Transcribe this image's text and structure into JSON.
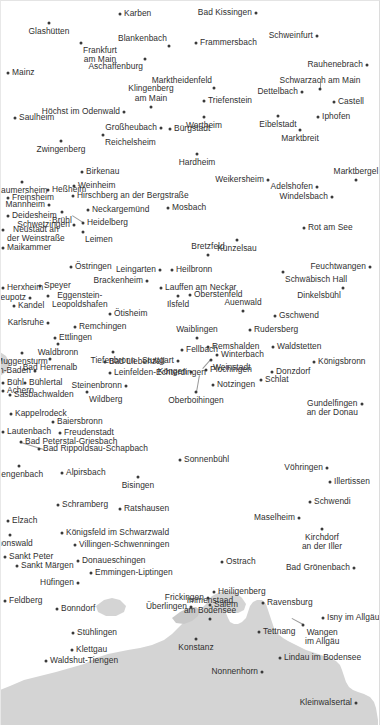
{
  "map": {
    "title": "Germany south-west place-name map",
    "background_color": "#ffffff",
    "dot_color": "#3a3a3a",
    "label_color": "#2f2f2f",
    "shaded_region_color": "#d3d3d3",
    "shaded_region_name": "neighbouring-country-shading",
    "cities": [
      {
        "name": "Karben",
        "x": 120,
        "y": 14,
        "pos": "pos-r"
      },
      {
        "name": "Bad Kissingen",
        "x": 256,
        "y": 13,
        "pos": "pos-l"
      },
      {
        "name": "Glashütten",
        "x": 49,
        "y": 23,
        "pos": "pos-b"
      },
      {
        "name": "Schweinfurt",
        "x": 317,
        "y": 36,
        "pos": "pos-l"
      },
      {
        "name": "Blankenbach",
        "x": 169,
        "y": 46,
        "pos": "pos-tl"
      },
      {
        "name": "Frammersbach",
        "x": 196,
        "y": 43,
        "pos": "pos-r"
      },
      {
        "name": "Frankfurt\nam Main",
        "x": 81,
        "y": 43,
        "pos": "pos-br",
        "lines": 2
      },
      {
        "name": "Rauhenebrach",
        "x": 367,
        "y": 65,
        "pos": "pos-l"
      },
      {
        "name": "Aschaffenburg",
        "x": 145,
        "y": 59,
        "pos": "pos-bl"
      },
      {
        "name": "Schwarzach am Main",
        "x": 320,
        "y": 89,
        "pos": "pos-t"
      },
      {
        "name": "Mainz",
        "x": 8,
        "y": 73,
        "pos": "pos-r"
      },
      {
        "name": "Marktheidenfeld",
        "x": 214,
        "y": 88,
        "pos": "pos-tl"
      },
      {
        "name": "Dettelbach",
        "x": 302,
        "y": 92,
        "pos": "pos-l"
      },
      {
        "name": "Castell",
        "x": 334,
        "y": 102,
        "pos": "pos-r"
      },
      {
        "name": "Klingenberg\nam Main",
        "x": 151,
        "y": 107,
        "pos": "pos-t",
        "lines": 2
      },
      {
        "name": "Triefenstein",
        "x": 204,
        "y": 101,
        "pos": "pos-r"
      },
      {
        "name": "Höchst im Odenwald",
        "x": 124,
        "y": 112,
        "pos": "pos-l"
      },
      {
        "name": "Wertheim",
        "x": 204,
        "y": 117,
        "pos": "pos-b"
      },
      {
        "name": "Eibelstadt",
        "x": 278,
        "y": 116,
        "pos": "pos-b"
      },
      {
        "name": "Iphofen",
        "x": 318,
        "y": 117,
        "pos": "pos-r"
      },
      {
        "name": "Saulheim",
        "x": 15,
        "y": 118,
        "pos": "pos-r"
      },
      {
        "name": "Großheubach",
        "x": 161,
        "y": 128,
        "pos": "pos-l"
      },
      {
        "name": "Bürgstadt",
        "x": 170,
        "y": 129,
        "pos": "pos-r"
      },
      {
        "name": "Marktbreit",
        "x": 300,
        "y": 130,
        "pos": "pos-b"
      },
      {
        "name": "Reichelsheim",
        "x": 103,
        "y": 135,
        "pos": "pos-br"
      },
      {
        "name": "Zwingenberg",
        "x": 61,
        "y": 141,
        "pos": "pos-b"
      },
      {
        "name": "Hardheim",
        "x": 197,
        "y": 154,
        "pos": "pos-b"
      },
      {
        "name": "Weikersheim",
        "x": 268,
        "y": 180,
        "pos": "pos-l"
      },
      {
        "name": "Marktbergel",
        "x": 356,
        "y": 180,
        "pos": "pos-t"
      },
      {
        "name": "Laumersheim",
        "x": 22,
        "y": 182,
        "pos": "pos-b"
      },
      {
        "name": "Birkenau",
        "x": 82,
        "y": 172,
        "pos": "pos-r"
      },
      {
        "name": "Adelshofen",
        "x": 317,
        "y": 187,
        "pos": "pos-l"
      },
      {
        "name": "Heßheim",
        "x": 48,
        "y": 190,
        "pos": "pos-r"
      },
      {
        "name": "Weinheim",
        "x": 74,
        "y": 186,
        "pos": "pos-r"
      },
      {
        "name": "Windelsbach",
        "x": 332,
        "y": 197,
        "pos": "pos-l"
      },
      {
        "name": "Freinsheim",
        "x": 8,
        "y": 198,
        "pos": "pos-r"
      },
      {
        "name": "Hirschberg an der Bergstraße",
        "x": 73,
        "y": 196,
        "pos": "pos-r"
      },
      {
        "name": "Mosbach",
        "x": 168,
        "y": 208,
        "pos": "pos-r"
      },
      {
        "name": "Mannheim",
        "x": 49,
        "y": 205,
        "pos": "pos-l"
      },
      {
        "name": "Neckargemünd",
        "x": 88,
        "y": 210,
        "pos": "pos-r"
      },
      {
        "name": "Deidesheim",
        "x": 8,
        "y": 216,
        "pos": "pos-r"
      },
      {
        "name": "Brühl",
        "x": 62,
        "y": 212,
        "pos": "pos-b"
      },
      {
        "name": "Heidelberg",
        "x": 83,
        "y": 223,
        "pos": "pos-r"
      },
      {
        "name": "Schwetzingen",
        "x": 74,
        "y": 225,
        "pos": "pos-l"
      },
      {
        "name": "Rot am See",
        "x": 304,
        "y": 228,
        "pos": "pos-r"
      },
      {
        "name": "Künzelsau",
        "x": 237,
        "y": 240,
        "pos": "pos-b"
      },
      {
        "name": "Leimen",
        "x": 83,
        "y": 232,
        "pos": "pos-br"
      },
      {
        "name": "Neustadt an\nder Weinstraße",
        "x": 3,
        "y": 230,
        "pos": "pos-r",
        "lines": 2
      },
      {
        "name": "Feuchtwangen",
        "x": 370,
        "y": 267,
        "pos": "pos-l"
      },
      {
        "name": "Maikammer",
        "x": 3,
        "y": 248,
        "pos": "pos-r"
      },
      {
        "name": "Bretzfeld",
        "x": 208,
        "y": 255,
        "pos": "pos-t"
      },
      {
        "name": "Östringen",
        "x": 71,
        "y": 267,
        "pos": "pos-r"
      },
      {
        "name": "Leingarten",
        "x": 160,
        "y": 270,
        "pos": "pos-l"
      },
      {
        "name": "Heilbronn",
        "x": 172,
        "y": 270,
        "pos": "pos-r"
      },
      {
        "name": "Schwäbisch Hall",
        "x": 283,
        "y": 272,
        "pos": "pos-br"
      },
      {
        "name": "Brackenheim",
        "x": 147,
        "y": 281,
        "pos": "pos-l"
      },
      {
        "name": "Lauffen am Neckar",
        "x": 161,
        "y": 288,
        "pos": "pos-r"
      },
      {
        "name": "Dinkelsbühl",
        "x": 343,
        "y": 288,
        "pos": "pos-bl"
      },
      {
        "name": "Herxheim",
        "x": 3,
        "y": 288,
        "pos": "pos-r"
      },
      {
        "name": "Speyer",
        "x": 40,
        "y": 286,
        "pos": "pos-r"
      },
      {
        "name": "Eggenstein-\nLeopoldshafen",
        "x": 48,
        "y": 296,
        "pos": "pos-r",
        "lines": 2
      },
      {
        "name": "Ilsfeld",
        "x": 178,
        "y": 296,
        "pos": "pos-b"
      },
      {
        "name": "Oberstenfeld",
        "x": 190,
        "y": 295,
        "pos": "pos-r"
      },
      {
        "name": "Neupotz",
        "x": 30,
        "y": 298,
        "pos": "pos-l"
      },
      {
        "name": "Auenwald",
        "x": 243,
        "y": 311,
        "pos": "pos-t"
      },
      {
        "name": "Kandel",
        "x": 14,
        "y": 306,
        "pos": "pos-r"
      },
      {
        "name": "Ötisheim",
        "x": 110,
        "y": 314,
        "pos": "pos-r"
      },
      {
        "name": "Gschwend",
        "x": 275,
        "y": 316,
        "pos": "pos-r"
      },
      {
        "name": "Karlsruhe",
        "x": 48,
        "y": 323,
        "pos": "pos-l"
      },
      {
        "name": "Remchingen",
        "x": 75,
        "y": 327,
        "pos": "pos-r"
      },
      {
        "name": "Rudersberg",
        "x": 250,
        "y": 330,
        "pos": "pos-r"
      },
      {
        "name": "Waiblingen",
        "x": 197,
        "y": 338,
        "pos": "pos-t"
      },
      {
        "name": "Ettlingen",
        "x": 55,
        "y": 338,
        "pos": "pos-r"
      },
      {
        "name": "Waldbronn",
        "x": 58,
        "y": 344,
        "pos": "pos-b"
      },
      {
        "name": "Tiefenbronn",
        "x": 113,
        "y": 352,
        "pos": "pos-b"
      },
      {
        "name": "Fellbach",
        "x": 182,
        "y": 350,
        "pos": "pos-r"
      },
      {
        "name": "Remshalden",
        "x": 208,
        "y": 347,
        "pos": "pos-r"
      },
      {
        "name": "Waldstetten",
        "x": 273,
        "y": 347,
        "pos": "pos-r"
      },
      {
        "name": "Muggensturm",
        "x": 22,
        "y": 353,
        "pos": "pos-b"
      },
      {
        "name": "Bad Herrenalb",
        "x": 50,
        "y": 359,
        "pos": "pos-b"
      },
      {
        "name": "Bad Liebenzell",
        "x": 105,
        "y": 362,
        "pos": "pos-r"
      },
      {
        "name": "Stuttgart",
        "x": 178,
        "y": 361,
        "pos": "pos-l"
      },
      {
        "name": "Winterbach",
        "x": 217,
        "y": 355,
        "pos": "pos-r"
      },
      {
        "name": "Weinstadt",
        "x": 211,
        "y": 360,
        "pos": "pos-br"
      },
      {
        "name": "Königsbronn",
        "x": 314,
        "y": 362,
        "pos": "pos-r"
      },
      {
        "name": "Baden-Baden",
        "x": 35,
        "y": 371,
        "pos": "pos-l"
      },
      {
        "name": "Leinfelden-Echterdingen",
        "x": 110,
        "y": 373,
        "pos": "pos-r"
      },
      {
        "name": "Köngen",
        "x": 191,
        "y": 372,
        "pos": "pos-l"
      },
      {
        "name": "Plochingen",
        "x": 206,
        "y": 370,
        "pos": "pos-r"
      },
      {
        "name": "Donzdorf",
        "x": 272,
        "y": 372,
        "pos": "pos-r"
      },
      {
        "name": "Bühl",
        "x": 3,
        "y": 383,
        "pos": "pos-r"
      },
      {
        "name": "Bühlertal",
        "x": 25,
        "y": 383,
        "pos": "pos-r"
      },
      {
        "name": "Steinenbronn",
        "x": 126,
        "y": 386,
        "pos": "pos-l"
      },
      {
        "name": "Notzingen",
        "x": 213,
        "y": 385,
        "pos": "pos-r"
      },
      {
        "name": "Schlat",
        "x": 261,
        "y": 380,
        "pos": "pos-r"
      },
      {
        "name": "Achern",
        "x": 3,
        "y": 391,
        "pos": "pos-r"
      },
      {
        "name": "Sasbachwalden",
        "x": 10,
        "y": 395,
        "pos": "pos-r"
      },
      {
        "name": "Wildberg",
        "x": 87,
        "y": 392,
        "pos": "pos-br"
      },
      {
        "name": "Oberboihingen",
        "x": 196,
        "y": 392,
        "pos": "pos-b"
      },
      {
        "name": "Kappelrodeck",
        "x": 11,
        "y": 414,
        "pos": "pos-r"
      },
      {
        "name": "Gundelfingen\nan der Donau",
        "x": 362,
        "y": 404,
        "pos": "pos-l",
        "lines": 2
      },
      {
        "name": "Baiersbronn",
        "x": 53,
        "y": 422,
        "pos": "pos-r"
      },
      {
        "name": "Lautenbach",
        "x": 3,
        "y": 432,
        "pos": "pos-r"
      },
      {
        "name": "Freudenstadt",
        "x": 60,
        "y": 433,
        "pos": "pos-r"
      },
      {
        "name": "Bad Peterstal-Griesbach",
        "x": 21,
        "y": 442,
        "pos": "pos-r"
      },
      {
        "name": "Sonnenbühl",
        "x": 180,
        "y": 460,
        "pos": "pos-r"
      },
      {
        "name": "Bad Rippoldsau-Schapbach",
        "x": 39,
        "y": 449,
        "pos": "pos-r"
      },
      {
        "name": "Vöhringen",
        "x": 327,
        "y": 468,
        "pos": "pos-l"
      },
      {
        "name": "Gengenbach",
        "x": 19,
        "y": 466,
        "pos": "pos-b"
      },
      {
        "name": "Illertissen",
        "x": 330,
        "y": 482,
        "pos": "pos-r"
      },
      {
        "name": "Alpirsbach",
        "x": 62,
        "y": 473,
        "pos": "pos-r"
      },
      {
        "name": "Bisingen",
        "x": 138,
        "y": 477,
        "pos": "pos-b"
      },
      {
        "name": "Schwendi",
        "x": 310,
        "y": 502,
        "pos": "pos-r"
      },
      {
        "name": "Schramberg",
        "x": 58,
        "y": 505,
        "pos": "pos-r"
      },
      {
        "name": "Ratshausen",
        "x": 120,
        "y": 509,
        "pos": "pos-r"
      },
      {
        "name": "Maselheim",
        "x": 299,
        "y": 518,
        "pos": "pos-l"
      },
      {
        "name": "Elzach",
        "x": 8,
        "y": 521,
        "pos": "pos-r"
      },
      {
        "name": "Königsfeld im Schwarzwald",
        "x": 62,
        "y": 533,
        "pos": "pos-r"
      },
      {
        "name": "Kirchdorf\nan der Iller",
        "x": 322,
        "y": 529,
        "pos": "pos-b",
        "lines": 2
      },
      {
        "name": "Simonswald",
        "x": 10,
        "y": 535,
        "pos": "pos-b"
      },
      {
        "name": "Villingen-Schwenningen",
        "x": 75,
        "y": 545,
        "pos": "pos-r"
      },
      {
        "name": "Ostrach",
        "x": 222,
        "y": 562,
        "pos": "pos-r"
      },
      {
        "name": "Sankt Peter",
        "x": 5,
        "y": 557,
        "pos": "pos-r"
      },
      {
        "name": "Donaueschingen",
        "x": 78,
        "y": 561,
        "pos": "pos-r"
      },
      {
        "name": "Bad Grönenbach",
        "x": 354,
        "y": 568,
        "pos": "pos-l"
      },
      {
        "name": "Sankt Märgen",
        "x": 17,
        "y": 566,
        "pos": "pos-r"
      },
      {
        "name": "Emmingen-Liptingen",
        "x": 91,
        "y": 573,
        "pos": "pos-r"
      },
      {
        "name": "Hüfingen",
        "x": 78,
        "y": 583,
        "pos": "pos-l"
      },
      {
        "name": "Frickingen",
        "x": 208,
        "y": 598,
        "pos": "pos-l"
      },
      {
        "name": "Heiligenberg",
        "x": 214,
        "y": 592,
        "pos": "pos-r"
      },
      {
        "name": "Ravensburg",
        "x": 263,
        "y": 603,
        "pos": "pos-r"
      },
      {
        "name": "Feldberg",
        "x": 5,
        "y": 601,
        "pos": "pos-r"
      },
      {
        "name": "Bonndorf",
        "x": 57,
        "y": 609,
        "pos": "pos-r"
      },
      {
        "name": "Überlingen",
        "x": 191,
        "y": 607,
        "pos": "pos-l"
      },
      {
        "name": "Salem",
        "x": 210,
        "y": 605,
        "pos": "pos-r"
      },
      {
        "name": "Isny im Allgäu",
        "x": 323,
        "y": 618,
        "pos": "pos-r"
      },
      {
        "name": "Immenstaad\nam Bodensee",
        "x": 210,
        "y": 619,
        "pos": "pos-t",
        "lines": 2
      },
      {
        "name": "Tettnang",
        "x": 259,
        "y": 632,
        "pos": "pos-r"
      },
      {
        "name": "Wangen\nim Allgäu",
        "x": 303,
        "y": 625,
        "pos": "pos-br",
        "lines": 2
      },
      {
        "name": "Stühlingen",
        "x": 73,
        "y": 633,
        "pos": "pos-r"
      },
      {
        "name": "Konstanz",
        "x": 196,
        "y": 639,
        "pos": "pos-b"
      },
      {
        "name": "Klettgau",
        "x": 72,
        "y": 650,
        "pos": "pos-r"
      },
      {
        "name": "Lindau im Bodensee",
        "x": 280,
        "y": 658,
        "pos": "pos-r"
      },
      {
        "name": "Waldshut-Tiengen",
        "x": 46,
        "y": 661,
        "pos": "pos-r"
      },
      {
        "name": "Nonnenhorn",
        "x": 262,
        "y": 672,
        "pos": "pos-l"
      },
      {
        "name": "Kleinwalsertal",
        "x": 356,
        "y": 703,
        "pos": "pos-l"
      }
    ],
    "leaders": [
      {
        "from_x": 83,
        "from_y": 223,
        "to_x": 72,
        "to_y": 216
      },
      {
        "from_x": 320,
        "from_y": 89,
        "to_x": 320,
        "to_y": 79
      },
      {
        "from_x": 211,
        "from_y": 360,
        "to_x": 203,
        "to_y": 369
      },
      {
        "from_x": 196,
        "from_y": 392,
        "to_x": 199,
        "to_y": 375
      },
      {
        "from_x": 21,
        "from_y": 442,
        "to_x": 44,
        "to_y": 449
      },
      {
        "from_x": 303,
        "from_y": 625,
        "to_x": 292,
        "to_y": 619
      }
    ]
  }
}
